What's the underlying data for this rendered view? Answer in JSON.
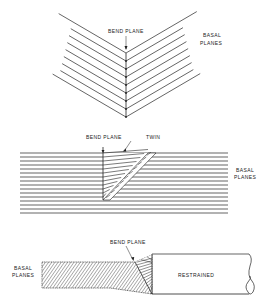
{
  "figure_top": {
    "title": "Kink band chevron",
    "labels": {
      "bend_plane": "BEND PLANE",
      "basal_line1": "BASAL",
      "basal_line2": "PLANES"
    },
    "apex_x": 126,
    "apex_top_y": 53,
    "chevron_count": 9,
    "chevron_spacing": 8
  },
  "figure_middle": {
    "labels": {
      "bend_plane": "BEND PLANE",
      "twin": "TWIN",
      "basal_line1": "BASAL",
      "basal_line2": "PLANES"
    },
    "line_count": 16,
    "line_start_y": 153,
    "line_spacing": 4
  },
  "figure_bottom": {
    "labels": {
      "basal_line1": "BASAL",
      "basal_line2": "PLANES",
      "bend_plane": "BEND PLANE",
      "restrained": "RESTRAINED"
    }
  },
  "colors": {
    "ink": "#222222",
    "background": "#ffffff"
  }
}
